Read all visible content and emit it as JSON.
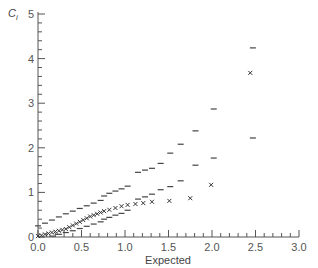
{
  "chart_data": {
    "type": "scatter",
    "title": "",
    "xlabel": "Expected",
    "ylabel": "C",
    "ylabel_subscript": "i",
    "xlim": [
      0,
      3.0
    ],
    "ylim": [
      0,
      5
    ],
    "x_ticks": [
      "0.0",
      "0.5",
      "1.0",
      "1.5",
      "2.0",
      "2.5",
      "3.0"
    ],
    "x_tick_values": [
      0,
      0.5,
      1.0,
      1.5,
      2.0,
      2.5,
      3.0
    ],
    "y_ticks": [
      "0",
      "1",
      "2",
      "3",
      "4",
      "5"
    ],
    "y_tick_values": [
      0,
      1,
      2,
      3,
      4,
      5
    ],
    "grid": false,
    "legend": null,
    "series": [
      {
        "name": "Observed",
        "marker": "x",
        "x": [
          0.0,
          0.04,
          0.08,
          0.12,
          0.16,
          0.2,
          0.24,
          0.28,
          0.32,
          0.36,
          0.4,
          0.44,
          0.48,
          0.52,
          0.56,
          0.6,
          0.64,
          0.68,
          0.72,
          0.76,
          0.82,
          0.89,
          0.96,
          1.03,
          1.12,
          1.21,
          1.31,
          1.51,
          1.75,
          1.99,
          2.44
        ],
        "y": [
          0.02,
          0.04,
          0.06,
          0.08,
          0.1,
          0.12,
          0.14,
          0.16,
          0.18,
          0.22,
          0.26,
          0.3,
          0.34,
          0.38,
          0.42,
          0.46,
          0.49,
          0.52,
          0.55,
          0.58,
          0.61,
          0.65,
          0.69,
          0.72,
          0.74,
          0.76,
          0.79,
          0.81,
          0.87,
          1.17,
          3.68
        ]
      },
      {
        "name": "Upper bound",
        "marker": "dash",
        "x": [
          0.0,
          0.08,
          0.16,
          0.24,
          0.32,
          0.4,
          0.48,
          0.56,
          0.64,
          0.72,
          0.76,
          0.82,
          0.89,
          0.96,
          1.03,
          1.15,
          1.23,
          1.31,
          1.41,
          1.52,
          1.64,
          1.81,
          2.02,
          2.47
        ],
        "y": [
          0.25,
          0.31,
          0.38,
          0.45,
          0.52,
          0.58,
          0.64,
          0.7,
          0.76,
          0.82,
          0.92,
          0.98,
          1.03,
          1.08,
          1.14,
          1.45,
          1.5,
          1.54,
          1.65,
          1.88,
          2.08,
          2.38,
          2.87,
          4.24
        ]
      },
      {
        "name": "Lower bound",
        "marker": "dash",
        "x": [
          0.16,
          0.24,
          0.32,
          0.4,
          0.48,
          0.56,
          0.64,
          0.72,
          0.76,
          0.82,
          0.89,
          0.96,
          1.03,
          1.15,
          1.23,
          1.31,
          1.41,
          1.52,
          1.64,
          1.81,
          2.02,
          2.47
        ],
        "y": [
          0.02,
          0.06,
          0.1,
          0.14,
          0.19,
          0.24,
          0.29,
          0.34,
          0.4,
          0.44,
          0.49,
          0.53,
          0.6,
          0.85,
          0.9,
          0.96,
          1.06,
          1.13,
          1.26,
          1.61,
          1.77,
          2.22
        ]
      }
    ]
  }
}
